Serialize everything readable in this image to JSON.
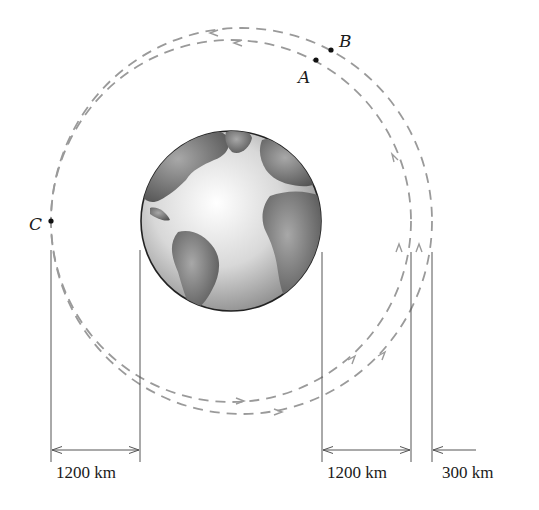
{
  "diagram": {
    "points": [
      {
        "id": "A",
        "label": "A"
      },
      {
        "id": "B",
        "label": "B"
      },
      {
        "id": "C",
        "label": "C"
      }
    ],
    "orbits": [
      {
        "name": "inner-orbit",
        "style": "dashed",
        "direction": "counterclockwise"
      },
      {
        "name": "outer-orbit",
        "style": "dashed",
        "direction": "counterclockwise"
      }
    ],
    "dimensions": [
      {
        "name": "left-altitude",
        "label": "1200 km"
      },
      {
        "name": "right-altitude",
        "label": "1200 km"
      },
      {
        "name": "orbit-gap",
        "label": "300 km"
      }
    ],
    "colors": {
      "orbit": "#9a9a9a",
      "line": "#555555",
      "text": "#1a1a1a",
      "earth_ocean": "#e8e8e8",
      "earth_land": "#7a7a7a"
    }
  }
}
